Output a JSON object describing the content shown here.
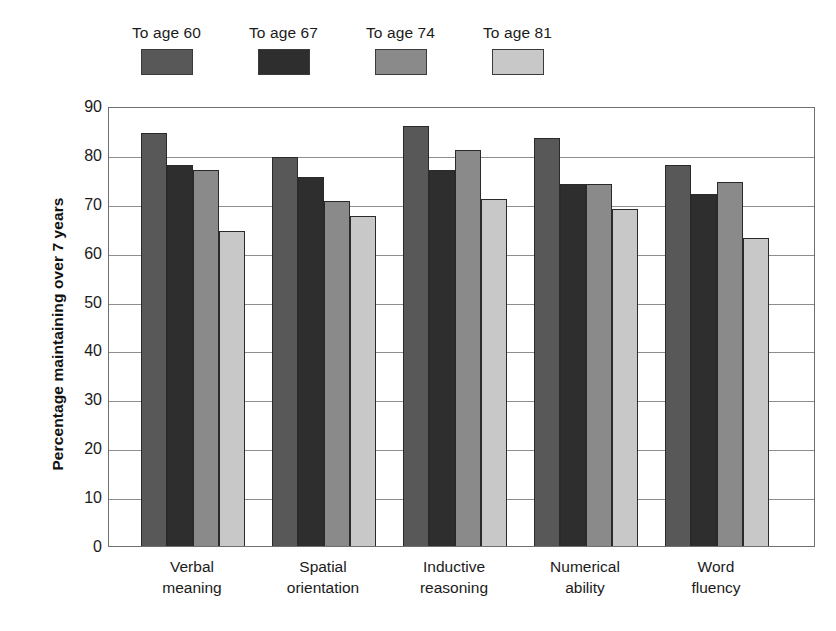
{
  "chart_data": {
    "type": "bar",
    "title": "",
    "xlabel": "",
    "ylabel": "Percentage maintaining over 7 years",
    "ylim": [
      0,
      90
    ],
    "ytick_step": 10,
    "yticks": [
      "90",
      "80",
      "70",
      "60",
      "50",
      "40",
      "30",
      "20",
      "10",
      "0"
    ],
    "grid": true,
    "legend_position": "top",
    "categories": [
      "Verbal\nmeaning",
      "Spatial\norientation",
      "Inductive\nreasoning",
      "Numerical\nability",
      "Word\nfluency"
    ],
    "category_lines": [
      [
        "Verbal",
        "meaning"
      ],
      [
        "Spatial",
        "orientation"
      ],
      [
        "Inductive",
        "reasoning"
      ],
      [
        "Numerical",
        "ability"
      ],
      [
        "Word",
        "fluency"
      ]
    ],
    "series": [
      {
        "name": "To age 60",
        "color": "#585858",
        "values": [
          84.5,
          79.5,
          86.0,
          83.5,
          78.0
        ]
      },
      {
        "name": "To age 67",
        "color": "#2e2e2e",
        "values": [
          78.0,
          75.5,
          77.0,
          74.0,
          72.0
        ]
      },
      {
        "name": "To age 74",
        "color": "#8a8a8a",
        "values": [
          77.0,
          70.5,
          81.0,
          74.0,
          74.5
        ]
      },
      {
        "name": "To age 81",
        "color": "#c8c8c8",
        "values": [
          64.5,
          67.5,
          71.0,
          69.0,
          63.0
        ]
      }
    ]
  },
  "legend": {
    "items": [
      {
        "label": "To age 60",
        "color": "#585858"
      },
      {
        "label": "To age 67",
        "color": "#2e2e2e"
      },
      {
        "label": "To age 74",
        "color": "#8a8a8a"
      },
      {
        "label": "To age 81",
        "color": "#c8c8c8"
      }
    ]
  },
  "axes": {
    "y_title": "Percentage maintaining over 7 years"
  }
}
